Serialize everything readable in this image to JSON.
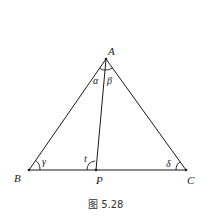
{
  "figure": {
    "caption": "图 5.28",
    "points": {
      "A": {
        "label": "A",
        "x": 106,
        "y": 59
      },
      "B": {
        "label": "B",
        "x": 29,
        "y": 170
      },
      "P": {
        "label": "P",
        "x": 96,
        "y": 170
      },
      "C": {
        "label": "C",
        "x": 186,
        "y": 170
      }
    },
    "angles": {
      "alpha": "α",
      "beta": "β",
      "gamma": "γ",
      "t": "t",
      "delta": "δ"
    },
    "colors": {
      "stroke": "#1a1a1a",
      "background": "#ffffff"
    }
  }
}
